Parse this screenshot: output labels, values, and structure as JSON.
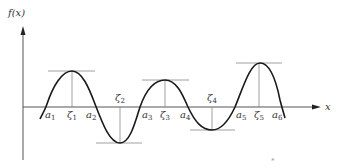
{
  "figure": {
    "y_axis_label": "f(x)",
    "x_axis_label": "x",
    "colors": {
      "curve": "#1a1a1a",
      "axis": "#555555",
      "guide": "#888888",
      "background": "#ffffff"
    },
    "zero_labels": [
      {
        "base": "a",
        "sub": "1"
      },
      {
        "base": "a",
        "sub": "2"
      },
      {
        "base": "a",
        "sub": "3"
      },
      {
        "base": "a",
        "sub": "4"
      },
      {
        "base": "a",
        "sub": "5"
      },
      {
        "base": "a",
        "sub": "6"
      }
    ],
    "extremum_labels": [
      {
        "base": "ζ",
        "sub": "1",
        "type": "max"
      },
      {
        "base": "ζ",
        "sub": "2",
        "type": "min"
      },
      {
        "base": "ζ",
        "sub": "3",
        "type": "max"
      },
      {
        "base": "ζ",
        "sub": "4",
        "type": "min"
      },
      {
        "base": "ζ",
        "sub": "5",
        "type": "max"
      }
    ],
    "stray_mark": "*"
  }
}
